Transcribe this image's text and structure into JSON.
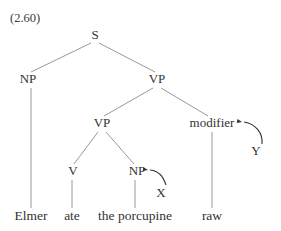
{
  "figure": {
    "example_number": "(2.60)",
    "kind": "syntax-tree",
    "ink_color": "#333333",
    "line_color": "#8c8c8c",
    "background_color": "#ffffff",
    "width": 281,
    "height": 231
  },
  "nodes": [
    {
      "id": "S",
      "label": "S",
      "x": 95,
      "y": 38,
      "kind": "category"
    },
    {
      "id": "NP1",
      "label": "NP",
      "x": 28,
      "y": 82,
      "kind": "category"
    },
    {
      "id": "VP1",
      "label": "VP",
      "x": 157,
      "y": 82,
      "kind": "category"
    },
    {
      "id": "VP2",
      "label": "VP",
      "x": 102,
      "y": 126,
      "kind": "category"
    },
    {
      "id": "MODIFIER",
      "label": "modifier",
      "x": 212,
      "y": 126,
      "kind": "category"
    },
    {
      "id": "V",
      "label": "V",
      "x": 73,
      "y": 174,
      "kind": "category"
    },
    {
      "id": "NP2",
      "label": "NP",
      "x": 137,
      "y": 174,
      "kind": "category"
    }
  ],
  "annotations": [
    {
      "id": "X",
      "label": "X",
      "x": 161,
      "y": 196,
      "points_to": "NP2"
    },
    {
      "id": "Y",
      "label": "Y",
      "x": 256,
      "y": 154,
      "points_to": "MODIFIER"
    }
  ],
  "words": [
    {
      "id": "w1",
      "label": "Elmer",
      "x": 31,
      "y": 220,
      "parent": "NP1"
    },
    {
      "id": "w2",
      "label": "ate",
      "x": 72,
      "y": 220,
      "parent": "V"
    },
    {
      "id": "w3",
      "label": "the porcupine",
      "x": 135,
      "y": 220,
      "parent": "NP2"
    },
    {
      "id": "w4",
      "label": "raw",
      "x": 212,
      "y": 220,
      "parent": "MODIFIER"
    }
  ],
  "edges": [
    {
      "from": "S",
      "to": "NP1",
      "x1": 91,
      "y1": 43,
      "x2": 31,
      "y2": 72
    },
    {
      "from": "S",
      "to": "VP1",
      "x1": 99,
      "y1": 43,
      "x2": 155,
      "y2": 72
    },
    {
      "from": "VP1",
      "to": "VP2",
      "x1": 153,
      "y1": 88,
      "x2": 104,
      "y2": 116
    },
    {
      "from": "VP1",
      "to": "MODIFIER",
      "x1": 161,
      "y1": 88,
      "x2": 208,
      "y2": 116
    },
    {
      "from": "VP2",
      "to": "V",
      "x1": 98,
      "y1": 132,
      "x2": 74,
      "y2": 164
    },
    {
      "from": "VP2",
      "to": "NP2",
      "x1": 106,
      "y1": 132,
      "x2": 134,
      "y2": 164
    },
    {
      "from": "NP1",
      "to": "w1",
      "x1": 31,
      "y1": 88,
      "x2": 31,
      "y2": 208
    },
    {
      "from": "V",
      "to": "w2",
      "x1": 72,
      "y1": 180,
      "x2": 72,
      "y2": 208
    },
    {
      "from": "NP2",
      "to": "w3",
      "x1": 135,
      "y1": 180,
      "x2": 135,
      "y2": 208
    },
    {
      "from": "MODIFIER",
      "to": "w4",
      "x1": 212,
      "y1": 132,
      "x2": 212,
      "y2": 208
    }
  ],
  "arrows": [
    {
      "id": "arrow-x",
      "from": "X",
      "to": "NP2",
      "path": "M 166 185 C 163 176, 159 171, 150 170",
      "head_x": 148,
      "head_y": 170,
      "head_angle": 190
    },
    {
      "id": "arrow-y",
      "from": "Y",
      "to": "MODIFIER",
      "path": "M 262 144 C 263 133, 256 124, 244 122",
      "head_x": 242,
      "head_y": 122,
      "head_angle": 192
    }
  ]
}
